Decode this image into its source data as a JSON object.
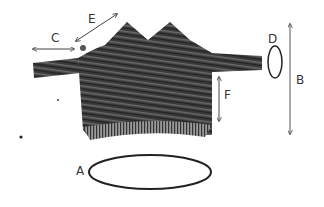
{
  "diagram": {
    "labels": {
      "A": "A",
      "B": "B",
      "C": "C",
      "D": "D",
      "E": "E",
      "F": "F"
    },
    "measurements": [
      {
        "key": "A",
        "meaning": "hem opening (ellipse)"
      },
      {
        "key": "B",
        "meaning": "total length (vertical arrow)"
      },
      {
        "key": "C",
        "meaning": "sleeve length (horizontal arrow)"
      },
      {
        "key": "D",
        "meaning": "cuff opening (ellipse)"
      },
      {
        "key": "E",
        "meaning": "shoulder slope (diagonal arrow)"
      },
      {
        "key": "F",
        "meaning": "side length (vertical arrow)"
      }
    ],
    "colors": {
      "garment_dark": "#2b2b2b",
      "garment_mid": "#5a5a5a",
      "line": "#444444",
      "background": "#ffffff"
    }
  }
}
